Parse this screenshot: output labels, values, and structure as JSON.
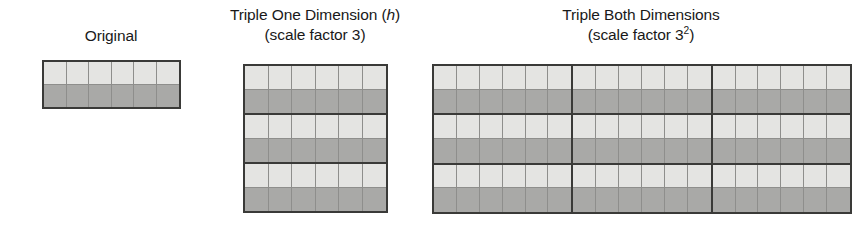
{
  "background_color": "#ffffff",
  "colors": {
    "light_cell": "#e4e4e2",
    "dark_cell": "#a9a9a7",
    "cell_gridline": "#8e8e8c",
    "block_border": "#3a3a38",
    "text": "#191919"
  },
  "figures": [
    {
      "id": "original",
      "caption_lines": [
        "Original"
      ],
      "caption_line1": "Original",
      "caption_line2": "",
      "unit_grid": {
        "columns": 6,
        "rows": 2,
        "row_shades": [
          "light",
          "dark"
        ]
      },
      "repeat_columns": 1,
      "repeat_rows": 1,
      "total_units": 1
    },
    {
      "id": "triple-one-dimension",
      "caption_lines": [
        "Triple One Dimension (h)",
        "(scale factor 3)"
      ],
      "caption_line1_pre": "Triple One Dimension (",
      "caption_line1_italic": "h",
      "caption_line1_post": ")",
      "caption_line2": "(scale factor 3)",
      "unit_grid": {
        "columns": 6,
        "rows": 2,
        "row_shades": [
          "light",
          "dark"
        ]
      },
      "repeat_columns": 1,
      "repeat_rows": 3,
      "total_units": 3,
      "scale_factor": "3"
    },
    {
      "id": "triple-both-dimensions",
      "caption_lines": [
        "Triple Both Dimensions",
        "(scale factor 3²)"
      ],
      "caption_line1": "Triple Both Dimensions",
      "caption_line2_pre": "(scale factor 3",
      "caption_line2_sup": "2",
      "caption_line2_post": ")",
      "unit_grid": {
        "columns": 6,
        "rows": 2,
        "row_shades": [
          "light",
          "dark"
        ]
      },
      "repeat_columns": 3,
      "repeat_rows": 3,
      "total_units": 9,
      "scale_factor": "3²"
    }
  ]
}
